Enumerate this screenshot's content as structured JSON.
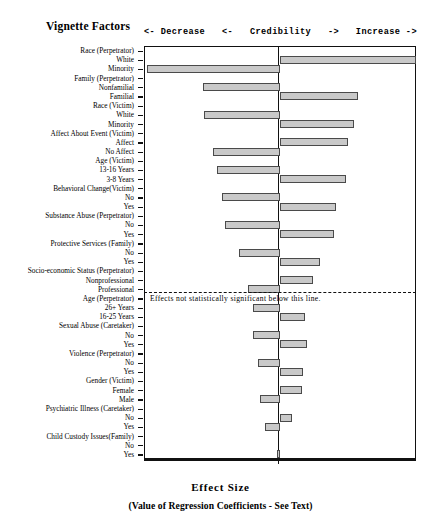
{
  "title": "Vignette Factors",
  "header": {
    "decrease": "<- Decrease",
    "arrow_left": "<-",
    "credibility": "Credibility",
    "arrow_right": "->",
    "increase": "Increase ->"
  },
  "annotation": "Effects not statistically   significant below this line.",
  "axis": {
    "xlabel": "Effect Size",
    "xsublabel": "(Value of Regression Coefficients - See Text)",
    "xticks": [
      -0.3,
      -0.2,
      -0.1,
      0,
      0.1,
      0.2,
      0.3
    ],
    "xticklabels": [
      "-0.3",
      "-0.2",
      "-0.1",
      "0",
      "0.1",
      "0.2",
      "0.3"
    ]
  },
  "colors": {
    "bar_fill": "#c9c9c9",
    "bar_edge": "#4a4a4a",
    "axis": "#111111"
  },
  "chart_data": {
    "type": "bar",
    "orientation": "horizontal",
    "title": "Vignette Factors",
    "xlabel": "Effect Size",
    "ylabel": "",
    "xlim": [
      -0.3,
      0.3
    ],
    "grid": false,
    "legend": null,
    "annotations": [
      {
        "text": "Effects not statistically significant below this line.",
        "y_between": [
          "Professional",
          "Age (Perpetrator)"
        ]
      }
    ],
    "categories": [
      "Race (Perpetrator)",
      "White",
      "Minority",
      "Family (Perpetrator)",
      "Nonfamilial",
      "Familial",
      "Race (Victim)",
      "White",
      "Minority",
      "Affect About Event (Victim)",
      "Affect",
      "No Affect",
      "Age (Victim)",
      "13-16 Years",
      "3-8 Years",
      "Behavioral  Change(Victim)",
      "No",
      "Yes",
      "Substance Abuse (Perpetrator)",
      "No",
      "Yes",
      "Protective Services (Family)",
      "No",
      "Yes",
      "Socio-economic Status (Perpetrator)",
      "Nonprofessional",
      "Professional",
      "Age (Perpetrator)",
      "26+ Years",
      "16-25 Years",
      "Sexual Abuse (Caretaker)",
      "No",
      "Yes",
      "Violence (Perpetrator)",
      "No",
      "Yes",
      "Gender (Victim)",
      "Female",
      "Male",
      "Psychiatric Illness (Caretaker)",
      "No",
      "Yes",
      "Child Custody Issues(Family)",
      "No",
      "Yes"
    ],
    "values": [
      null,
      0.3,
      -0.293,
      null,
      -0.169,
      0.173,
      null,
      -0.167,
      0.164,
      null,
      0.149,
      -0.147,
      null,
      -0.138,
      0.145,
      null,
      -0.127,
      0.123,
      null,
      -0.121,
      0.12,
      null,
      -0.09,
      0.088,
      null,
      0.073,
      -0.071,
      null,
      -0.06,
      0.056,
      null,
      -0.06,
      0.06,
      null,
      -0.049,
      0.051,
      null,
      0.049,
      -0.044,
      null,
      0.027,
      -0.032,
      null,
      0.0,
      -0.006
    ],
    "is_header_row": [
      true,
      false,
      false,
      true,
      false,
      false,
      true,
      false,
      false,
      true,
      false,
      false,
      true,
      false,
      false,
      true,
      false,
      false,
      true,
      false,
      false,
      true,
      false,
      false,
      true,
      false,
      false,
      true,
      false,
      false,
      true,
      false,
      false,
      true,
      false,
      false,
      true,
      false,
      false,
      true,
      false,
      false,
      true,
      false,
      false
    ]
  }
}
